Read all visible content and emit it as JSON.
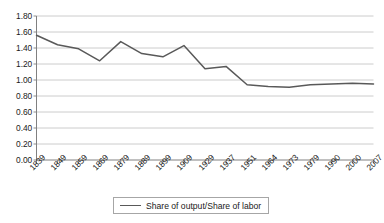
{
  "chart_data": {
    "type": "line",
    "title": "",
    "xlabel": "",
    "ylabel": "",
    "categories": [
      "1839",
      "1849",
      "1859",
      "1869",
      "1879",
      "1889",
      "1899",
      "1909",
      "1929",
      "1937",
      "1951",
      "1964",
      "1973",
      "1979",
      "1990",
      "2000",
      "2007"
    ],
    "series": [
      {
        "name": "Share of output/Share of labor",
        "color": "#595959",
        "values": [
          1.56,
          1.44,
          1.39,
          1.24,
          1.48,
          1.33,
          1.29,
          1.43,
          1.14,
          1.17,
          0.94,
          0.92,
          0.91,
          0.94,
          0.95,
          0.96,
          0.95
        ]
      }
    ],
    "ylim": [
      0.0,
      1.8
    ],
    "ytick_labels": [
      "1.80",
      "1.60",
      "1.40",
      "1.20",
      "1.00",
      "0.80",
      "0.60",
      "0.40",
      "0.20",
      "0.00"
    ],
    "ytick_values": [
      1.8,
      1.6,
      1.4,
      1.2,
      1.0,
      0.8,
      0.6,
      0.4,
      0.2,
      0.0
    ],
    "grid": "horizontal",
    "legend_position": "bottom-center",
    "legend_entries": [
      {
        "label": "Share of output/Share of labor",
        "marker": "line"
      }
    ]
  },
  "colors": {
    "series_line": "#595959",
    "gridline": "#bfbfbf",
    "axis": "#808080",
    "text": "#1a1a1a",
    "background": "#ffffff",
    "legend_border": "#a6a6a6"
  }
}
